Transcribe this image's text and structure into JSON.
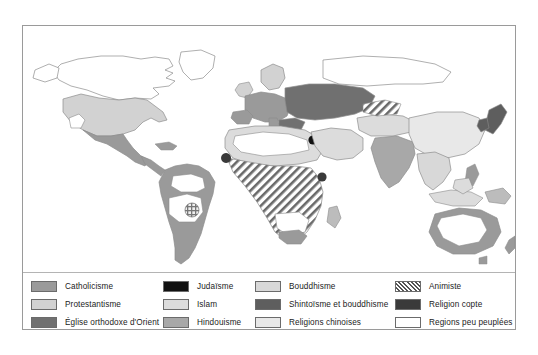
{
  "figure": {
    "kind": "thematic-world-map",
    "title_visible": false,
    "background_color": "#ffffff",
    "frame_border_color": "#9a9a9a"
  },
  "map": {
    "projection": "world-mercator-like",
    "ocean_color": "#ffffff",
    "coastline_color": "#8c8c8c",
    "regions": [
      {
        "name": "arctic-canada-greenland",
        "category": "regions_peu_peuplees"
      },
      {
        "name": "united-states",
        "category": "protestantisme"
      },
      {
        "name": "mexico-central-america",
        "category": "catholicisme"
      },
      {
        "name": "south-america",
        "category": "catholicisme"
      },
      {
        "name": "amazon-basin",
        "category": "regions_peu_peuplees"
      },
      {
        "name": "brazil-interior-patch",
        "category": "animiste"
      },
      {
        "name": "western-europe",
        "category": "catholicisme"
      },
      {
        "name": "northern-europe",
        "category": "protestantisme"
      },
      {
        "name": "eastern-europe-russia",
        "category": "eglise_orthodoxe_orient"
      },
      {
        "name": "siberia",
        "category": "regions_peu_peuplees"
      },
      {
        "name": "north-africa-middle-east",
        "category": "islam"
      },
      {
        "name": "sahara",
        "category": "regions_peu_peuplees"
      },
      {
        "name": "sub-saharan-africa",
        "category": "animiste"
      },
      {
        "name": "israel",
        "category": "judaisme"
      },
      {
        "name": "ethiopia-egypt-copts",
        "category": "religion_copte"
      },
      {
        "name": "india",
        "category": "hindouisme"
      },
      {
        "name": "southeast-asia",
        "category": "bouddhisme"
      },
      {
        "name": "china",
        "category": "religions_chinoises"
      },
      {
        "name": "japan",
        "category": "shintoisme_et_bouddhisme"
      },
      {
        "name": "central-asia",
        "category": "islam"
      },
      {
        "name": "indonesia-malaysia",
        "category": "islam"
      },
      {
        "name": "australia-coast",
        "category": "protestantisme"
      },
      {
        "name": "australia-interior",
        "category": "regions_peu_peuplees"
      }
    ]
  },
  "legend": {
    "columns": [
      {
        "name": "column-1",
        "items": [
          {
            "key": "catholicisme",
            "label": "Catholicisme",
            "color": "#9a9a9a",
            "pattern": "solid"
          },
          {
            "key": "protestantisme",
            "label": "Protestantisme",
            "color": "#d2d2d2",
            "pattern": "solid"
          },
          {
            "key": "eglise_orthodoxe_orient",
            "label": "Église orthodoxe d'Orient",
            "color": "#707070",
            "pattern": "solid"
          }
        ]
      },
      {
        "name": "column-2",
        "items": [
          {
            "key": "judaisme",
            "label": "Judaïsme",
            "color": "#111111",
            "pattern": "solid"
          },
          {
            "key": "islam",
            "label": "Islam",
            "color": "#dcdcdc",
            "pattern": "solid"
          },
          {
            "key": "hindouisme",
            "label": "Hindouisme",
            "color": "#a8a8a8",
            "pattern": "solid"
          }
        ]
      },
      {
        "name": "column-3",
        "items": [
          {
            "key": "bouddhisme",
            "label": "Bouddhisme",
            "color": "#d8d8d8",
            "pattern": "solid"
          },
          {
            "key": "shintoisme_et_bouddhisme",
            "label": "Shintoïsme et bouddhisme",
            "color": "#5e5e5e",
            "pattern": "solid"
          },
          {
            "key": "religions_chinoises",
            "label": "Religions chinoises",
            "color": "#e8e8e8",
            "pattern": "solid"
          }
        ]
      },
      {
        "name": "column-4",
        "items": [
          {
            "key": "animiste",
            "label": "Animiste",
            "color": "#ffffff",
            "pattern": "diagonal-hatch"
          },
          {
            "key": "religion_copte",
            "label": "Religion copte",
            "color": "#3a3a3a",
            "pattern": "solid"
          },
          {
            "key": "regions_peu_peuplees",
            "label": "Regions peu peuplées",
            "color": "#ffffff",
            "pattern": "solid"
          }
        ]
      }
    ]
  }
}
